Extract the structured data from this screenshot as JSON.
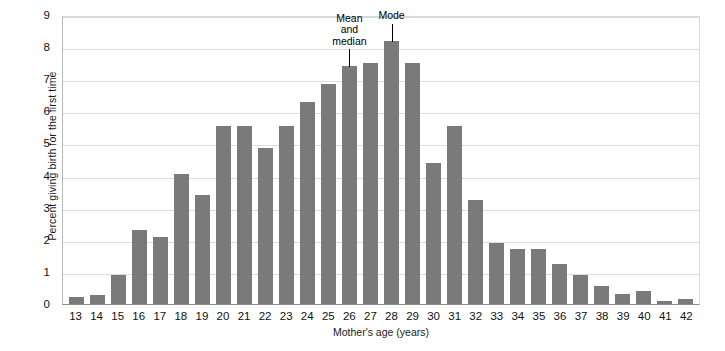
{
  "chart_data": {
    "type": "bar",
    "title": "",
    "subtitle": "",
    "xlabel": "Mother's age (years)",
    "ylabel": "Percent giving birth for the first time",
    "categories": [
      "13",
      "14",
      "15",
      "16",
      "17",
      "18",
      "19",
      "20",
      "21",
      "22",
      "23",
      "24",
      "25",
      "26",
      "27",
      "28",
      "29",
      "30",
      "31",
      "32",
      "33",
      "34",
      "35",
      "36",
      "37",
      "38",
      "39",
      "40",
      "41",
      "42"
    ],
    "values": [
      0.22,
      0.28,
      0.9,
      2.3,
      2.1,
      4.05,
      3.4,
      5.55,
      5.55,
      4.85,
      5.55,
      6.3,
      6.85,
      7.4,
      7.5,
      8.2,
      7.5,
      4.4,
      5.55,
      3.25,
      1.9,
      1.7,
      1.7,
      1.25,
      0.9,
      0.55,
      0.3,
      0.4,
      0.08,
      0.15
    ],
    "ylim": [
      0,
      9
    ],
    "yticks": [
      0,
      1,
      2,
      3,
      4,
      5,
      6,
      7,
      8,
      9
    ],
    "ytick_labels": [
      "0",
      "1",
      "2",
      "3",
      "4",
      "5",
      "6",
      "7",
      "8",
      "9"
    ],
    "grid": true,
    "grid_axis": "y",
    "legend": false,
    "bar_color": "#7a7a7a",
    "grid_color": "#dcdcdc",
    "axis_color": "#8e8e8e",
    "annotations": [
      {
        "id": "mean-median",
        "text": "Mean\nand\nmedian",
        "target_category": "26",
        "target_value": 7.4
      },
      {
        "id": "mode",
        "text": "Mode",
        "target_category": "28",
        "target_value": 8.2
      }
    ]
  }
}
